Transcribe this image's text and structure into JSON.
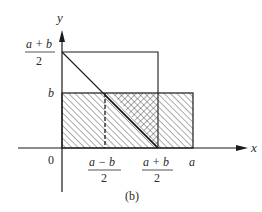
{
  "figure": {
    "caption": "(b)",
    "axes": {
      "x_label": "x",
      "y_label": "y",
      "origin_label": "0"
    },
    "y_ticks": [
      {
        "numerator": "a + b",
        "denominator": "2"
      },
      {
        "label": "b"
      }
    ],
    "x_ticks": [
      {
        "numerator": "a − b",
        "denominator": "2"
      },
      {
        "numerator": "a + b",
        "denominator": "2"
      },
      {
        "label": "a"
      }
    ],
    "colors": {
      "line": "#1a1a1a",
      "hatch": "#333333",
      "background": "#ffffff"
    }
  }
}
